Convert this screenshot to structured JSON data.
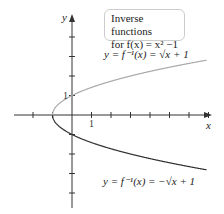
{
  "chart_data": {
    "type": "line",
    "xlabel": "x",
    "ylabel": "y",
    "xlim": [
      -2,
      7
    ],
    "ylim": [
      -4,
      4
    ],
    "tick_labels": {
      "x": [
        "1"
      ],
      "y": [
        "1"
      ]
    },
    "series": [
      {
        "name": "y = f^-1(x) = sqrt(x + 1)",
        "color": "#aaaaaa",
        "x": [
          -1,
          0,
          1,
          2,
          3,
          4,
          5,
          6,
          7
        ],
        "y": [
          0,
          1,
          1.414,
          1.732,
          2,
          2.236,
          2.449,
          2.646,
          2.828
        ]
      },
      {
        "name": "y = f^-1(x) = -sqrt(x + 1)",
        "color": "#333333",
        "x": [
          -1,
          0,
          1,
          2,
          3,
          4,
          5,
          6,
          7
        ],
        "y": [
          0,
          -1,
          -1.414,
          -1.732,
          -2,
          -2.236,
          -2.449,
          -2.646,
          -2.828
        ]
      }
    ]
  },
  "box": {
    "line1": "Inverse functions",
    "line2": "for f(x) = x² −1"
  },
  "labels": {
    "upper": "y = f⁻¹(x) = √x + 1",
    "lower": "y = f⁻¹(x) = −√x + 1",
    "x_axis": "x",
    "y_axis": "y",
    "x_tick": "1",
    "y_tick": "1"
  }
}
